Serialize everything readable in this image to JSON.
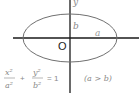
{
  "diagram": {
    "type": "ellipse",
    "axis_labels": {
      "y": "y"
    },
    "origin_label": "O",
    "semi_axis_labels": {
      "minor": "b",
      "major": "a"
    },
    "equation": {
      "term1_num": "x²",
      "term1_den": "a²",
      "plus": "+",
      "term2_num": "y²",
      "term2_den": "b²",
      "equals": "= 1",
      "condition": "(a > b)"
    },
    "colors": {
      "axis": "#1a1a1a",
      "ellipse": "#707070",
      "label": "#8a8a8a",
      "origin": "#222222"
    }
  }
}
